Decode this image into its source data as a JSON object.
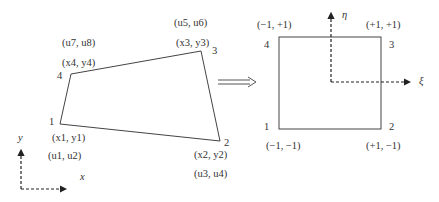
{
  "physical_element": {
    "nodes": [
      {
        "id": "1",
        "coord": "(x1, y1)",
        "dof": "(u1, u2)"
      },
      {
        "id": "2",
        "coord": "(x2, y2)",
        "dof": "(u3, u4)"
      },
      {
        "id": "3",
        "coord": "(x3, y3)",
        "dof": "(u5, u6)"
      },
      {
        "id": "4",
        "coord": "(x4, y4)",
        "dof": "(u7, u8)"
      }
    ],
    "axes": {
      "x_label": "x",
      "y_label": "y"
    }
  },
  "mapping_arrow": "⟹",
  "reference_element": {
    "nodes": [
      {
        "id": "1",
        "coord": "(−1, −1)"
      },
      {
        "id": "2",
        "coord": "(+1, −1)"
      },
      {
        "id": "3",
        "coord": "(+1, +1)"
      },
      {
        "id": "4",
        "coord": "(−1, +1)"
      }
    ],
    "axes": {
      "xi_label": "ξ",
      "eta_label": "η"
    }
  },
  "colors": {
    "line": "#444444",
    "background": "#ffffff"
  }
}
